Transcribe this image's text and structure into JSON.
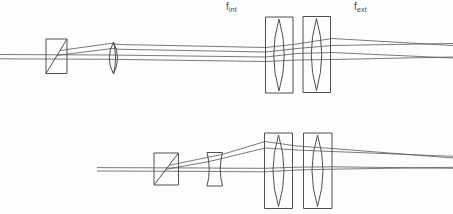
{
  "labels": {
    "f_int": {
      "base": "f",
      "sub": "int"
    },
    "f_ext": {
      "base": "f",
      "sub": "ext"
    }
  },
  "colors": {
    "background": "#fdfdfd",
    "line": "#4f4f4f",
    "text": "#4a4a4a"
  },
  "diagram": {
    "components": [
      {
        "name": "beamsplitter-cube-top",
        "type": "beamsplitter",
        "rect": [
          46,
          39,
          21,
          34.5
        ],
        "diagonal": [
          [
            46,
            73.5
          ],
          [
            67,
            39
          ]
        ]
      },
      {
        "name": "relay-lens-top",
        "type": "convex-lens",
        "outline": "M 113.5 42 Q 105 58 113.5 74 Q 121.5 58 113.5 42 Z",
        "inner": "M 113.5 42 Q 117.5 58 113.5 74"
      },
      {
        "name": "telescope-housing-left-top",
        "type": "housing",
        "rect": [
          265.5,
          17,
          27.5,
          76
        ]
      },
      {
        "name": "telescope-lens-left-top",
        "type": "convex-lens",
        "outline": "M 279 19 Q 268.5 55 279 91 Q 289.5 55 279 19 Z"
      },
      {
        "name": "telescope-housing-right-top",
        "type": "housing",
        "rect": [
          303,
          16.5,
          27.5,
          76
        ]
      },
      {
        "name": "telescope-lens-right-top",
        "type": "convex-lens",
        "outline": "M 316.5 18.5 Q 306 54.5 316.5 90.5 Q 327 54.5 316.5 18.5 Z"
      },
      {
        "name": "beamsplitter-cube-bottom",
        "type": "beamsplitter",
        "rect": [
          154,
          153,
          24.5,
          32
        ],
        "diagonal": [
          [
            154,
            185
          ],
          [
            178.5,
            153
          ]
        ]
      },
      {
        "name": "concave-lens-bottom",
        "type": "concave-lens",
        "outline": "M 207 152.5 L 222.5 152.5 Q 218 169.5 222.5 186 L 207 186 Q 211.5 169.5 207 152.5 Z"
      },
      {
        "name": "telescope-housing-left-bottom",
        "type": "housing",
        "rect": [
          264.5,
          133,
          28,
          75.5
        ]
      },
      {
        "name": "telescope-lens-left-bottom",
        "type": "convex-lens",
        "outline": "M 278.5 135 Q 267.5 170.5 278.5 206.5 Q 289.5 170.5 278.5 135 Z"
      },
      {
        "name": "telescope-housing-right-bottom",
        "type": "housing",
        "rect": [
          303.5,
          133,
          28.5,
          75.5
        ]
      },
      {
        "name": "telescope-lens-right-bottom",
        "type": "convex-lens",
        "outline": "M 317.5 135 Q 306.5 170.5 317.5 206.5 Q 328.5 170.5 317.5 135 Z"
      }
    ],
    "rays": [
      {
        "name": "top-input-ray-upper",
        "points": [
          [
            0,
            54.5
          ],
          [
            110,
            55
          ],
          [
            266,
            57
          ],
          [
            297,
            53.5
          ],
          [
            332,
            52.5
          ],
          [
            453,
            58
          ]
        ]
      },
      {
        "name": "top-input-ray-lower",
        "points": [
          [
            0,
            58.8
          ],
          [
            110,
            59.3
          ],
          [
            266,
            61.5
          ],
          [
            297,
            60
          ],
          [
            332,
            59.5
          ],
          [
            453,
            57
          ]
        ]
      },
      {
        "name": "top-fan-ray-upper",
        "points": [
          [
            60,
            50.5
          ],
          [
            110,
            43.5
          ],
          [
            120,
            44.5
          ],
          [
            266,
            47.5
          ],
          [
            297,
            44
          ],
          [
            332,
            38.5
          ],
          [
            453,
            45.5
          ]
        ]
      },
      {
        "name": "top-fan-ray-lower",
        "points": [
          [
            57,
            55.4
          ],
          [
            112,
            48.5
          ],
          [
            121,
            49.3
          ],
          [
            266,
            52
          ],
          [
            297,
            48.5
          ],
          [
            332,
            45.5
          ],
          [
            453,
            43.5
          ]
        ]
      },
      {
        "name": "bottom-input-ray-upper",
        "points": [
          [
            97,
            167.6
          ],
          [
            209,
            168
          ],
          [
            222,
            168.2
          ],
          [
            265,
            168.3
          ],
          [
            297,
            167.2
          ],
          [
            332,
            166.8
          ],
          [
            453,
            168.3
          ]
        ]
      },
      {
        "name": "bottom-input-ray-lower",
        "points": [
          [
            97,
            171
          ],
          [
            209,
            171.4
          ],
          [
            222,
            171.6
          ],
          [
            265,
            171.8
          ],
          [
            297,
            170
          ],
          [
            332,
            169.2
          ],
          [
            453,
            167.3
          ]
        ]
      },
      {
        "name": "bottom-fan-ray-upper",
        "points": [
          [
            169,
            165.4
          ],
          [
            209,
            157
          ],
          [
            222,
            154.5
          ],
          [
            265,
            141.5
          ],
          [
            297,
            146
          ],
          [
            332,
            148.5
          ],
          [
            453,
            158
          ]
        ]
      },
      {
        "name": "bottom-fan-ray-lower",
        "points": [
          [
            166,
            169.3
          ],
          [
            209,
            161.5
          ],
          [
            222,
            158.5
          ],
          [
            265,
            148
          ],
          [
            297,
            150
          ],
          [
            332,
            151.5
          ],
          [
            453,
            156.3
          ]
        ]
      }
    ]
  }
}
